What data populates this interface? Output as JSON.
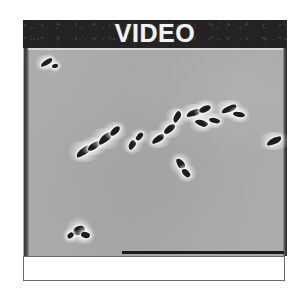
{
  "figure": {
    "panel_label": "VIDEO",
    "caption": "",
    "background_color": "#ffffff"
  },
  "header": {
    "title": "VIDEO",
    "background_color": "#232323",
    "text_color": "#f2f2f2"
  },
  "micrograph": {
    "name": "phase-contrast-micrograph",
    "background_color": "#b9b9b9",
    "cell_color": "#1d1d1d",
    "halo_color": "#ffffff",
    "description": "",
    "cells": [
      {
        "x": 17,
        "y": 12,
        "w": 13,
        "h": 5,
        "rot": -28,
        "shape": "comma"
      },
      {
        "x": 29,
        "y": 16,
        "w": 6,
        "h": 4,
        "rot": -12,
        "shape": "blob"
      },
      {
        "x": 52,
        "y": 100,
        "w": 17,
        "h": 7,
        "rot": -32,
        "shape": "comma"
      },
      {
        "x": 64,
        "y": 95,
        "w": 14,
        "h": 6,
        "rot": -35,
        "shape": "rod"
      },
      {
        "x": 74,
        "y": 87,
        "w": 16,
        "h": 7,
        "rot": -38,
        "shape": "comma"
      },
      {
        "x": 86,
        "y": 80,
        "w": 12,
        "h": 6,
        "rot": -42,
        "shape": "blob"
      },
      {
        "x": 104,
        "y": 94,
        "w": 10,
        "h": 6,
        "rot": -55,
        "shape": "comma"
      },
      {
        "x": 112,
        "y": 86,
        "w": 9,
        "h": 5,
        "rot": -50,
        "shape": "rod"
      },
      {
        "x": 128,
        "y": 88,
        "w": 14,
        "h": 6,
        "rot": -30,
        "shape": "comma"
      },
      {
        "x": 140,
        "y": 78,
        "w": 13,
        "h": 6,
        "rot": -40,
        "shape": "rod"
      },
      {
        "x": 148,
        "y": 66,
        "w": 12,
        "h": 6,
        "rot": -58,
        "shape": "comma"
      },
      {
        "x": 163,
        "y": 62,
        "w": 15,
        "h": 6,
        "rot": -18,
        "shape": "comma"
      },
      {
        "x": 176,
        "y": 58,
        "w": 12,
        "h": 6,
        "rot": -25,
        "shape": "rod"
      },
      {
        "x": 172,
        "y": 72,
        "w": 13,
        "h": 6,
        "rot": 22,
        "shape": "comma"
      },
      {
        "x": 186,
        "y": 70,
        "w": 11,
        "h": 5,
        "rot": 14,
        "shape": "blob"
      },
      {
        "x": 198,
        "y": 58,
        "w": 16,
        "h": 6,
        "rot": -20,
        "shape": "comma"
      },
      {
        "x": 210,
        "y": 64,
        "w": 12,
        "h": 5,
        "rot": 10,
        "shape": "rod"
      },
      {
        "x": 152,
        "y": 112,
        "w": 11,
        "h": 7,
        "rot": 62,
        "shape": "comma"
      },
      {
        "x": 158,
        "y": 122,
        "w": 10,
        "h": 6,
        "rot": 48,
        "shape": "blob"
      },
      {
        "x": 243,
        "y": 90,
        "w": 16,
        "h": 6,
        "rot": -22,
        "shape": "comma"
      },
      {
        "x": 50,
        "y": 178,
        "w": 12,
        "h": 9,
        "rot": -20,
        "shape": "blob"
      },
      {
        "x": 58,
        "y": 184,
        "w": 9,
        "h": 6,
        "rot": 18,
        "shape": "blob"
      },
      {
        "x": 44,
        "y": 185,
        "w": 7,
        "h": 5,
        "rot": -40,
        "shape": "blob"
      }
    ],
    "scale_bar": {
      "label": "",
      "color": "#1a1a1a"
    }
  }
}
